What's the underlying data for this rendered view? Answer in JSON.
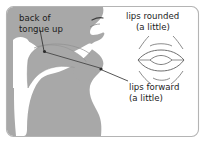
{
  "figure": {
    "colors": {
      "head_fill": "#a8a8a8",
      "cavity_fill": "#ffffff",
      "outline": "#6e6e6e",
      "border": "#b4b4b4",
      "text": "#1c1c1c",
      "background": "#ffffff"
    },
    "labels": {
      "tongue": {
        "line1": "back of",
        "line2": "tongue up"
      },
      "lips_rounded": {
        "line1": "lips rounded",
        "line2": "(a little)"
      },
      "lips_forward": {
        "line1": "lips forward",
        "line2": "(a little)"
      }
    },
    "annotations": [
      {
        "name": "tongue-pointer",
        "target": "back of tongue",
        "marker": "dot"
      },
      {
        "name": "lips-pointer",
        "target": "lips",
        "marker": "dot"
      }
    ],
    "lips_diagram": {
      "name": "rounded-lips-front-view",
      "arcs_above": 2,
      "arcs_below": 2,
      "opening": "lens"
    }
  }
}
